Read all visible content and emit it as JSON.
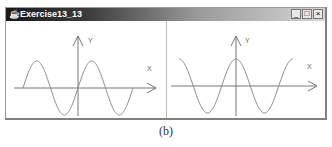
{
  "window": {
    "title": "Exercise13_13",
    "app_icon": "java-cup-icon",
    "controls": {
      "minimize": "_",
      "maximize": "□",
      "close": "×"
    }
  },
  "panels": [
    {
      "name": "sine-panel",
      "function": "sin",
      "x_label": "X",
      "y_label": "Y"
    },
    {
      "name": "cosine-panel",
      "function": "cos",
      "x_label": "X",
      "y_label": "Y"
    }
  ],
  "colors": {
    "curve": "#8a8a8a",
    "axis": "#777777"
  },
  "caption": "(b)"
}
